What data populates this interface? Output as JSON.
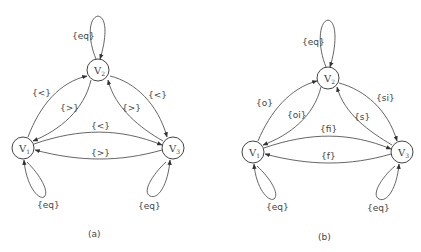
{
  "diagrams": [
    {
      "caption": "(a)",
      "nodes": [
        {
          "id": "V2",
          "base": "V",
          "sub": "2"
        },
        {
          "id": "V1",
          "base": "V",
          "sub": "1"
        },
        {
          "id": "V3",
          "base": "V",
          "sub": "3"
        }
      ],
      "edges": [
        {
          "from": "V2",
          "to": "V2",
          "label": "{eq}"
        },
        {
          "from": "V1",
          "to": "V2",
          "label": "{<}"
        },
        {
          "from": "V2",
          "to": "V1",
          "label": "{>}"
        },
        {
          "from": "V3",
          "to": "V2",
          "label": "{>}"
        },
        {
          "from": "V2",
          "to": "V3",
          "label": "{<}"
        },
        {
          "from": "V1",
          "to": "V3",
          "label": "{<}"
        },
        {
          "from": "V3",
          "to": "V1",
          "label": "{>}"
        },
        {
          "from": "V1",
          "to": "V1",
          "label": "{eq}"
        },
        {
          "from": "V3",
          "to": "V3",
          "label": "{eq}"
        }
      ]
    },
    {
      "caption": "(b)",
      "nodes": [
        {
          "id": "V2",
          "base": "V",
          "sub": "2"
        },
        {
          "id": "V1",
          "base": "V",
          "sub": "1"
        },
        {
          "id": "V3",
          "base": "V",
          "sub": "3"
        }
      ],
      "edges": [
        {
          "from": "V2",
          "to": "V2",
          "label": "{eq}"
        },
        {
          "from": "V1",
          "to": "V2",
          "label": "{o}"
        },
        {
          "from": "V2",
          "to": "V1",
          "label": "{oi}"
        },
        {
          "from": "V3",
          "to": "V2",
          "label": "{s}"
        },
        {
          "from": "V2",
          "to": "V3",
          "label": "{si}"
        },
        {
          "from": "V1",
          "to": "V3",
          "label": "{fi}"
        },
        {
          "from": "V3",
          "to": "V1",
          "label": "{f}"
        },
        {
          "from": "V1",
          "to": "V1",
          "label": "{eq}"
        },
        {
          "from": "V3",
          "to": "V3",
          "label": "{eq}"
        }
      ]
    }
  ]
}
